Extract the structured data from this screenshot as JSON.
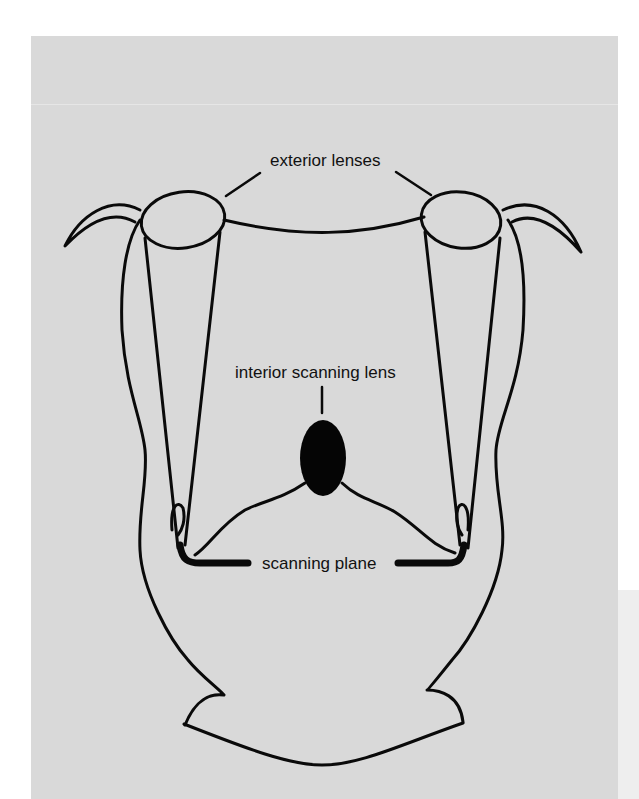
{
  "figure": {
    "background_color": "#d9d9d9",
    "stroke_color": "#0a0a0a",
    "labels": {
      "exterior_lenses": "exterior lenses",
      "interior_scanning_lens": "interior scanning lens",
      "scanning_plane": "scanning plane"
    },
    "parts": [
      {
        "id": "exterior-lens-left",
        "label": "exterior lenses"
      },
      {
        "id": "exterior-lens-right",
        "label": "exterior lenses"
      },
      {
        "id": "interior-scanning-lens",
        "label": "interior scanning lens"
      },
      {
        "id": "scanning-plane",
        "label": "scanning plane"
      }
    ]
  }
}
